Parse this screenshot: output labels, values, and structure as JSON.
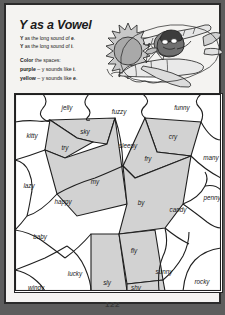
{
  "worksheet": {
    "title": "Y as a Vowel",
    "rules": [
      {
        "lead": "Y",
        "text": " as the long sound of ",
        "emph": "e",
        "tail": "."
      },
      {
        "lead": "Y",
        "text": " as the long sound of ",
        "emph": "i",
        "tail": "."
      }
    ],
    "color_instruction_lead": "Color",
    "color_instruction_rest": " the spaces:",
    "key": [
      {
        "color_word": "purple",
        "separator": " – ",
        "description": "y sounds like ",
        "letter": "i",
        "tail": ".",
        "swatch": "#b9b9b9"
      },
      {
        "color_word": "yellow",
        "separator": " – ",
        "description": "y sounds like ",
        "letter": "e",
        "tail": ".",
        "swatch": "#ffffff"
      }
    ],
    "page_number": "122"
  },
  "artwork": {
    "name": "pilot-in-biplane-with-sun",
    "sun_color": "#b0b0b0",
    "plane_color": "#d8d8d8"
  },
  "colors": {
    "shaded_fill": "#d2d2d2",
    "plain_fill": "#ffffff",
    "stroke": "#1f1f1f",
    "page_background": "#f4f3f1",
    "frame": "#2b2b2b"
  },
  "puzzle": {
    "shaded_legend": "purple",
    "plain_legend": "yellow",
    "cells": [
      {
        "word": "jelly",
        "sound": "e",
        "shaded": false,
        "x": 52,
        "y": 14
      },
      {
        "word": "fuzzy",
        "sound": "e",
        "shaded": false,
        "x": 104,
        "y": 18
      },
      {
        "word": "funny",
        "sound": "e",
        "shaded": false,
        "x": 167,
        "y": 14
      },
      {
        "word": "kitty",
        "sound": "e",
        "shaded": false,
        "x": 17,
        "y": 42
      },
      {
        "word": "sky",
        "sound": "i",
        "shaded": true,
        "x": 70,
        "y": 38
      },
      {
        "word": "try",
        "sound": "i",
        "shaded": true,
        "x": 50,
        "y": 54
      },
      {
        "word": "sleepy",
        "sound": "e",
        "shaded": false,
        "x": 113,
        "y": 52
      },
      {
        "word": "cry",
        "sound": "i",
        "shaded": true,
        "x": 158,
        "y": 43
      },
      {
        "word": "many",
        "sound": "e",
        "shaded": false,
        "x": 196,
        "y": 64
      },
      {
        "word": "fry",
        "sound": "i",
        "shaded": true,
        "x": 133,
        "y": 65
      },
      {
        "word": "lazy",
        "sound": "e",
        "shaded": false,
        "x": 14,
        "y": 92
      },
      {
        "word": "my",
        "sound": "i",
        "shaded": true,
        "x": 80,
        "y": 88
      },
      {
        "word": "happy",
        "sound": "e",
        "shaded": false,
        "x": 48,
        "y": 108
      },
      {
        "word": "by",
        "sound": "i",
        "shaded": true,
        "x": 126,
        "y": 109
      },
      {
        "word": "candy",
        "sound": "e",
        "shaded": false,
        "x": 163,
        "y": 116
      },
      {
        "word": "penny",
        "sound": "e",
        "shaded": false,
        "x": 197,
        "y": 104
      },
      {
        "word": "baby",
        "sound": "e",
        "shaded": false,
        "x": 25,
        "y": 143
      },
      {
        "word": "fly",
        "sound": "i",
        "shaded": true,
        "x": 119,
        "y": 157
      },
      {
        "word": "lucky",
        "sound": "e",
        "shaded": false,
        "x": 60,
        "y": 180
      },
      {
        "word": "sly",
        "sound": "i",
        "shaded": true,
        "x": 92,
        "y": 189
      },
      {
        "word": "shy",
        "sound": "i",
        "shaded": true,
        "x": 121,
        "y": 197
      },
      {
        "word": "sunny",
        "sound": "e",
        "shaded": false,
        "x": 149,
        "y": 178
      },
      {
        "word": "windy",
        "sound": "e",
        "shaded": false,
        "x": 21,
        "y": 194
      },
      {
        "word": "rocky",
        "sound": "e",
        "shaded": false,
        "x": 187,
        "y": 188
      }
    ]
  }
}
